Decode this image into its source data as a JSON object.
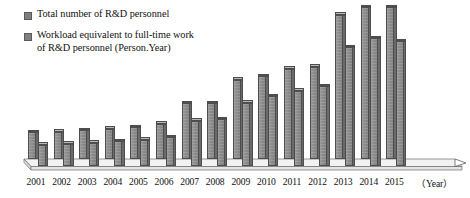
{
  "legend": {
    "items": [
      {
        "name": "series-total-personnel",
        "label": "Total number of R&D personnel",
        "color": "#808080"
      },
      {
        "name": "series-fte-personnel",
        "label": "Workload equivalent to full-time work\nof R&D personnel (Person.Year)",
        "color": "#808080"
      }
    ]
  },
  "axis": {
    "unit_label": "（Year）",
    "x_title": "Year"
  },
  "chart_data": {
    "type": "bar",
    "title": "",
    "subtitle": "",
    "xlabel": "Year",
    "ylabel": "",
    "grid": false,
    "legend_position": "top-left",
    "style": "3d-clustered-column",
    "categories": [
      "2001",
      "2002",
      "2003",
      "2004",
      "2005",
      "2006",
      "2007",
      "2008",
      "2009",
      "2010",
      "2011",
      "2012",
      "2013",
      "2014",
      "2015"
    ],
    "ylim": [
      0,
      600
    ],
    "series": [
      {
        "name": "Total number of R&D personnel",
        "unit": "10 thousand persons",
        "color": "#808080",
        "values": [
          95,
          97,
          101,
          107,
          112,
          124,
          197,
          197,
          280,
          292,
          318,
          325,
          510,
          536,
          536
        ]
      },
      {
        "name": "Workload equivalent to full-time work of R&D personnel (Person.Year)",
        "unit": "10 thousand person-years",
        "color": "#808080",
        "values": [
          74,
          78,
          83,
          88,
          92,
          101,
          160,
          165,
          224,
          246,
          265,
          282,
          420,
          452,
          440
        ]
      }
    ],
    "annotations": []
  },
  "geometry": {
    "baseline_y": 166,
    "plot_top_y": 10,
    "depth_dx": 7,
    "depth_dy": 7,
    "bar_width": 10.5,
    "group_pitch": 25.6,
    "first_group_left": 28,
    "max_bar_px": 152,
    "value_to_px": 0.283
  }
}
